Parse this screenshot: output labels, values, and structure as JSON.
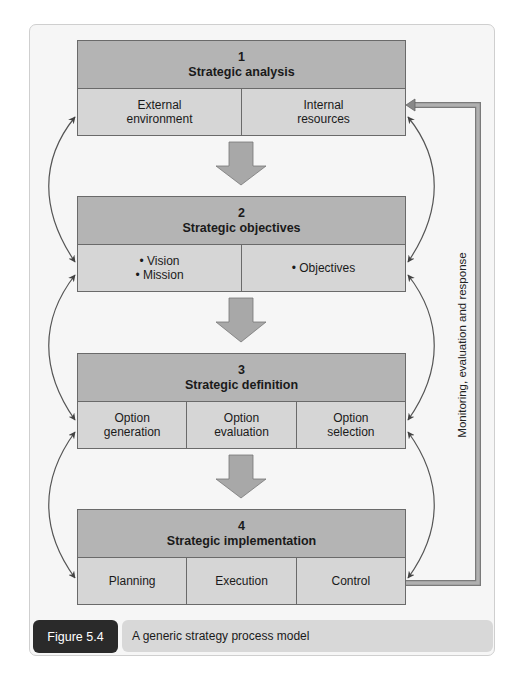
{
  "diagram": {
    "stages": [
      {
        "number": "1",
        "title": "Strategic analysis",
        "cells": [
          {
            "lines": [
              "External",
              "environment"
            ]
          },
          {
            "lines": [
              "Internal",
              "resources"
            ]
          }
        ]
      },
      {
        "number": "2",
        "title": "Strategic objectives",
        "cells": [
          {
            "lines": [
              "• Vision",
              "• Mission"
            ]
          },
          {
            "lines": [
              "• Objectives"
            ]
          }
        ]
      },
      {
        "number": "3",
        "title": "Strategic definition",
        "cells": [
          {
            "lines": [
              "Option",
              "generation"
            ]
          },
          {
            "lines": [
              "Option",
              "evaluation"
            ]
          },
          {
            "lines": [
              "Option",
              "selection"
            ]
          }
        ]
      },
      {
        "number": "4",
        "title": "Strategic implementation",
        "cells": [
          {
            "lines": [
              "Planning"
            ]
          },
          {
            "lines": [
              "Execution"
            ]
          },
          {
            "lines": [
              "Control"
            ]
          }
        ]
      }
    ],
    "feedback_label": "Monitoring, evaluation and response",
    "colors": {
      "header_fill": "#b4b4b4",
      "body_fill": "#d6d6d6",
      "arrow_fill": "#a8a8a8",
      "border": "#6a6a6a",
      "caption_label_bg": "#2a2a2a",
      "caption_text_bg": "#d8d8d8"
    }
  },
  "caption": {
    "label": "Figure 5.4",
    "text": "A generic strategy process model"
  }
}
